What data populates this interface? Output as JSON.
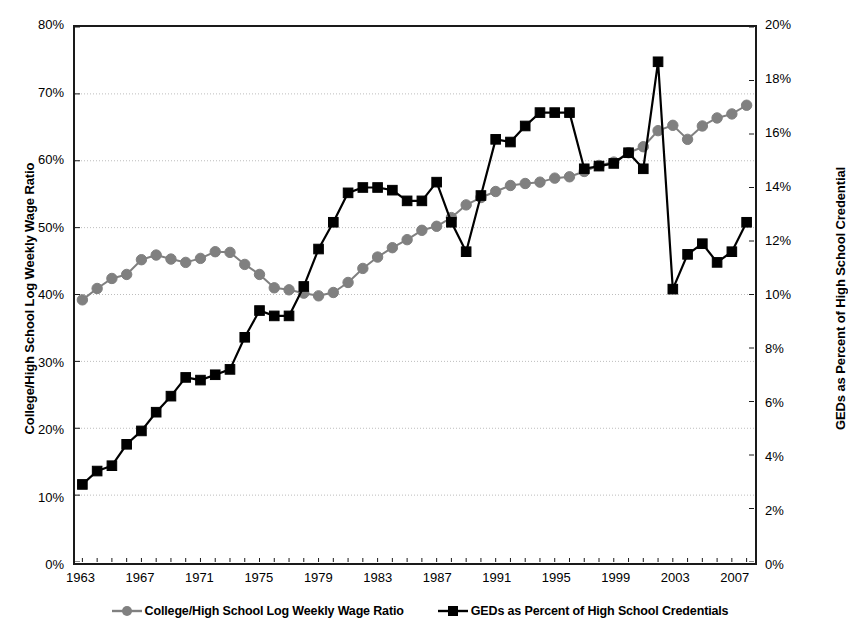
{
  "chart_data": {
    "type": "line",
    "title": "",
    "xlabel": "",
    "grid": "horizontal-dotted",
    "legend_position": "bottom-center",
    "x": [
      1963,
      1964,
      1965,
      1966,
      1967,
      1968,
      1969,
      1970,
      1971,
      1972,
      1973,
      1974,
      1975,
      1976,
      1977,
      1978,
      1979,
      1980,
      1981,
      1982,
      1983,
      1984,
      1985,
      1986,
      1987,
      1988,
      1989,
      1990,
      1991,
      1992,
      1993,
      1994,
      1995,
      1996,
      1997,
      1998,
      1999,
      2000,
      2001,
      2002,
      2003,
      2004,
      2005,
      2006,
      2007,
      2008
    ],
    "x_tick_labels": [
      "1963",
      "1967",
      "1971",
      "1975",
      "1979",
      "1983",
      "1987",
      "1991",
      "1995",
      "1999",
      "2003",
      "2007"
    ],
    "x_tick_values": [
      1963,
      1967,
      1971,
      1975,
      1979,
      1983,
      1987,
      1991,
      1995,
      1999,
      2003,
      2007
    ],
    "xlim": [
      1962.5,
      2008.5
    ],
    "left_axis": {
      "label": "College/High School Log Weekly Wage Ratio",
      "ticks": [
        "0%",
        "10%",
        "20%",
        "30%",
        "40%",
        "50%",
        "60%",
        "70%",
        "80%"
      ],
      "tick_values": [
        0,
        10,
        20,
        30,
        40,
        50,
        60,
        70,
        80
      ],
      "lim": [
        0,
        80
      ]
    },
    "right_axis": {
      "label": "GEDs as Percent of High School Credential",
      "ticks": [
        "0%",
        "2%",
        "4%",
        "6%",
        "8%",
        "10%",
        "12%",
        "14%",
        "16%",
        "18%",
        "20%"
      ],
      "tick_values": [
        0,
        2,
        4,
        6,
        8,
        10,
        12,
        14,
        16,
        18,
        20
      ],
      "lim": [
        0,
        20
      ]
    },
    "series": [
      {
        "name": "College/High School Log Weekly Wage Ratio",
        "axis": "left",
        "marker": "circle",
        "color": "#808080",
        "values": [
          39.2,
          40.9,
          42.4,
          43.0,
          45.2,
          45.9,
          45.3,
          44.8,
          45.4,
          46.4,
          46.3,
          44.5,
          43.0,
          41.0,
          40.7,
          40.2,
          39.8,
          40.3,
          41.8,
          43.9,
          45.6,
          47.0,
          48.2,
          49.6,
          50.2,
          51.5,
          53.4,
          54.5,
          55.4,
          56.3,
          56.6,
          56.8,
          57.4,
          57.6,
          58.4,
          59.3,
          59.8,
          61.2,
          62.1,
          64.5,
          65.3,
          63.2,
          65.2,
          66.4,
          67.0,
          68.3
        ]
      },
      {
        "name": "GEDs as Percent of High School Credentials",
        "axis": "right",
        "marker": "square",
        "color": "#000000",
        "values": [
          2.9,
          3.4,
          3.6,
          4.4,
          4.9,
          5.6,
          6.2,
          6.9,
          6.8,
          7.0,
          7.2,
          8.4,
          9.4,
          9.2,
          9.2,
          10.3,
          11.7,
          12.7,
          13.8,
          14.0,
          14.0,
          13.9,
          13.5,
          13.5,
          14.2,
          12.7,
          11.6,
          13.7,
          15.8,
          15.7,
          16.3,
          16.8,
          16.8,
          16.8,
          14.7,
          14.8,
          14.9,
          15.3,
          14.7,
          18.7,
          10.2,
          11.5,
          11.9,
          11.2,
          11.6,
          12.7
        ]
      }
    ]
  },
  "legend": {
    "items": [
      {
        "label": "College/High School Log Weekly Wage Ratio",
        "marker": "circle",
        "color": "#808080"
      },
      {
        "label": "GEDs as Percent of High School Credentials",
        "marker": "square",
        "color": "#000000"
      }
    ]
  }
}
